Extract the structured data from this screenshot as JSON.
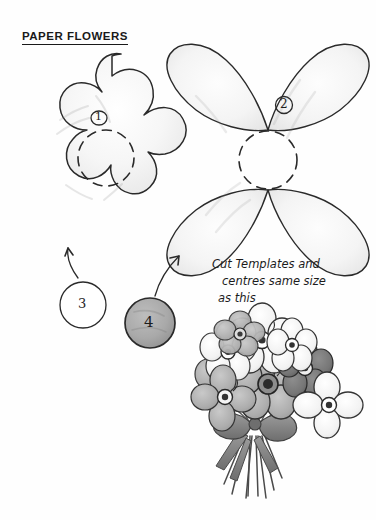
{
  "page": {
    "title": "PAPER FLOWERS",
    "background_color": "#fefefe",
    "ink_color": "#1d1d1d",
    "shading_color": "#a9a9a9"
  },
  "templates": [
    {
      "id": "template-1",
      "label": "1",
      "label_style": "circled",
      "shape": "five-petal-flower",
      "petals": 5,
      "fill": "light-pencil-shading",
      "center": "dashed-circle",
      "center_label": "centre cutting line"
    },
    {
      "id": "template-2",
      "label": "2",
      "label_style": "circled",
      "shape": "four-petal-flower",
      "petals": 4,
      "fill": "light-pencil-shading",
      "center": "dashed-circle",
      "center_label": "centre cutting line"
    },
    {
      "id": "template-3",
      "label": "3",
      "label_style": "plain",
      "shape": "circle",
      "fill": "none"
    },
    {
      "id": "template-4",
      "label": "4",
      "label_style": "plain",
      "shape": "circle",
      "fill": "grey"
    }
  ],
  "arrows": [
    {
      "id": "arrow-3-to-1",
      "from": "template-3",
      "to": "template-1",
      "direction": "up-left"
    },
    {
      "id": "arrow-4-to-2",
      "from": "template-4",
      "to": "template-2",
      "direction": "up-right"
    }
  ],
  "note": {
    "line1": "Cut Templates and",
    "line2": "centres  same size",
    "line3": "as this"
  },
  "illustration": {
    "name": "flower-bouquet-sketch",
    "description": "pencil sketch of a bouquet of flowers tied with a ribbon bow",
    "flower_count": 9,
    "has_bow": true,
    "has_stems": true
  }
}
